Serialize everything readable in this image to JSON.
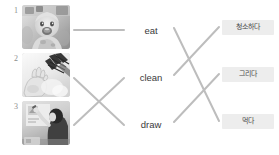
{
  "worksheet": {
    "type": "matching-exercise",
    "background_color": "#ffffff",
    "line_color": "#bdbdbd",
    "chip_color": "#ededed"
  },
  "picture_column": {
    "items": [
      {
        "number": "1",
        "label": "baby-eating-photo",
        "description": "baby in high chair eating messily",
        "top": 5,
        "num_top": 7
      },
      {
        "number": "2",
        "label": "hands-cleaning-photo",
        "description": "hands with cleaning brush scrubbing",
        "top": 53,
        "num_top": 55
      },
      {
        "number": "3",
        "label": "child-drawing-photo",
        "description": "child drawing on a wall",
        "top": 101,
        "num_top": 103
      }
    ]
  },
  "word_column": {
    "items": [
      {
        "label": "eat",
        "top": 26
      },
      {
        "label": "clean",
        "top": 73
      },
      {
        "label": "draw",
        "top": 120
      }
    ]
  },
  "translation_column": {
    "items": [
      {
        "label": "청소하다",
        "meaning_of": "clean",
        "top": 20
      },
      {
        "label": "그리다",
        "meaning_of": "draw",
        "top": 67
      },
      {
        "label": "먹다",
        "meaning_of": "eat",
        "top": 114
      }
    ]
  },
  "connections": {
    "left_group": [
      {
        "name": "link-picture1-eat",
        "x1": 74,
        "y1": 30,
        "x2": 124,
        "y2": 30
      },
      {
        "name": "link-picture2-draw",
        "x1": 74,
        "y1": 78,
        "x2": 124,
        "y2": 125
      },
      {
        "name": "link-picture3-clean",
        "x1": 74,
        "y1": 125,
        "x2": 124,
        "y2": 78
      }
    ],
    "right_group": [
      {
        "name": "link-eat-meokda",
        "x1": 174,
        "y1": 28,
        "x2": 219,
        "y2": 121
      },
      {
        "name": "link-clean-cheongso",
        "x1": 174,
        "y1": 75,
        "x2": 219,
        "y2": 27
      },
      {
        "name": "link-draw-geurida",
        "x1": 174,
        "y1": 122,
        "x2": 219,
        "y2": 74
      }
    ]
  }
}
